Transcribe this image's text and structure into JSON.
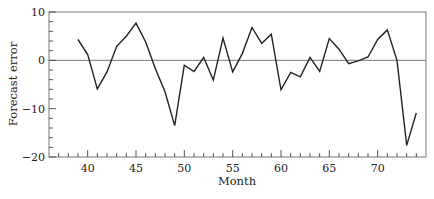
{
  "chart_data": {
    "type": "line",
    "title": "",
    "xlabel": "Month",
    "ylabel": "Forecast error",
    "xlim": [
      36,
      75
    ],
    "ylim": [
      -20,
      10
    ],
    "x_ticks": [
      40,
      45,
      50,
      55,
      60,
      65,
      70
    ],
    "x_tick_labels": [
      "40",
      "45",
      "50",
      "55",
      "60",
      "65",
      "70"
    ],
    "x_minor_step": 1,
    "y_ticks": [
      10,
      0,
      -10,
      -20
    ],
    "y_tick_labels": [
      "10",
      "0",
      "−10",
      "−20"
    ],
    "y_minor_step": 2,
    "reference_line": 0,
    "grid": false,
    "legend": null,
    "series": [
      {
        "name": "Forecast error",
        "color": "#222222",
        "x": [
          39,
          40,
          41,
          42,
          43,
          44,
          45,
          46,
          47,
          48,
          49,
          50,
          51,
          52,
          53,
          54,
          55,
          56,
          57,
          58,
          59,
          60,
          61,
          62,
          63,
          64,
          65,
          66,
          67,
          68,
          69,
          70,
          71,
          72,
          73,
          74
        ],
        "values": [
          4.3,
          1.2,
          -5.9,
          -2.4,
          2.9,
          5.0,
          7.7,
          3.8,
          -1.7,
          -6.5,
          -13.5,
          -1.0,
          -2.3,
          0.6,
          -4.1,
          4.6,
          -2.4,
          1.4,
          6.8,
          3.5,
          5.4,
          -6.1,
          -2.5,
          -3.4,
          0.6,
          -2.3,
          4.5,
          2.3,
          -0.7,
          -0.1,
          0.7,
          4.3,
          6.3,
          0.0,
          -17.6,
          -10.9
        ]
      }
    ]
  },
  "layout": {
    "plot_left": 49,
    "plot_right": 426,
    "plot_top": 12,
    "plot_bottom": 157
  }
}
